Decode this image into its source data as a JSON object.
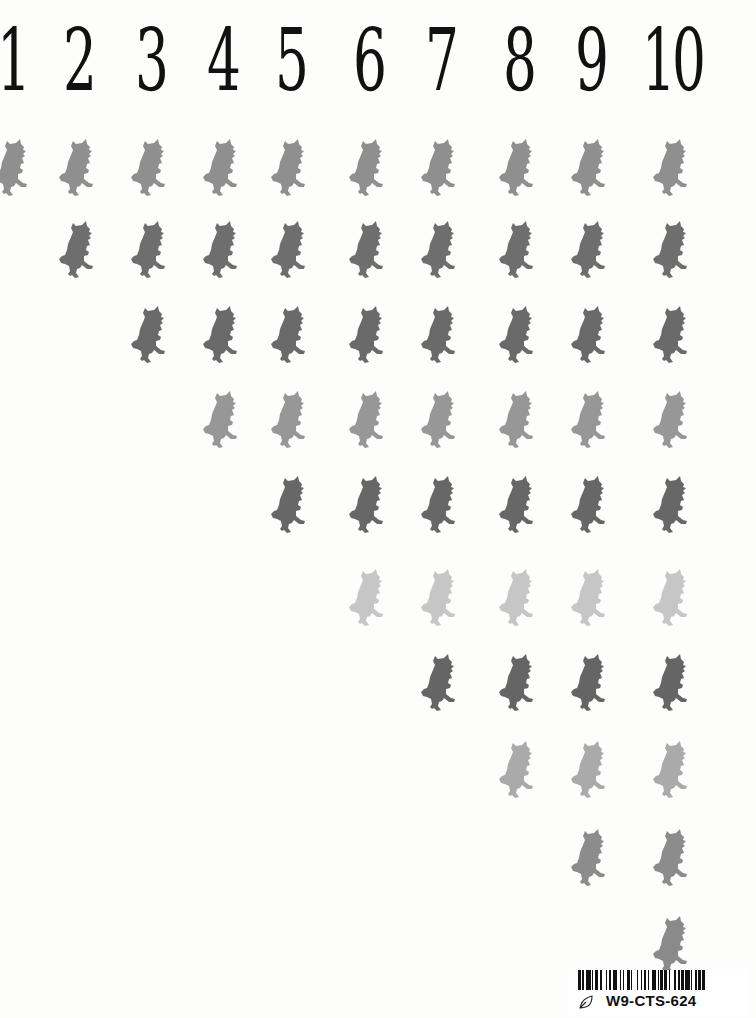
{
  "page": {
    "numbers": [
      "1",
      "2",
      "3",
      "4",
      "5",
      "6",
      "7",
      "8",
      "9",
      "10"
    ],
    "number_x": [
      12,
      78,
      150,
      222,
      290,
      368,
      440,
      518,
      590,
      672
    ],
    "figure_icon": "gruffalo-silhouette-icon",
    "rows": [
      {
        "row": 1,
        "y": 168,
        "start_col": 1,
        "color": "#8f8f8f"
      },
      {
        "row": 2,
        "y": 250,
        "start_col": 2,
        "color": "#6e6e6e"
      },
      {
        "row": 3,
        "y": 335,
        "start_col": 3,
        "color": "#6a6a6a"
      },
      {
        "row": 4,
        "y": 420,
        "start_col": 4,
        "color": "#979797"
      },
      {
        "row": 5,
        "y": 505,
        "start_col": 5,
        "color": "#676767"
      },
      {
        "row": 6,
        "y": 598,
        "start_col": 6,
        "color": "#c6c6c6"
      },
      {
        "row": 7,
        "y": 683,
        "start_col": 7,
        "color": "#656565"
      },
      {
        "row": 8,
        "y": 770,
        "start_col": 8,
        "color": "#aaaaaa"
      },
      {
        "row": 9,
        "y": 858,
        "start_col": 9,
        "color": "#8c8c8c"
      },
      {
        "row": 10,
        "y": 945,
        "start_col": 10,
        "color": "#8a8a8a"
      }
    ]
  },
  "sticker": {
    "barcode_icon": "barcode-icon",
    "leaf_icon": "leaf-outline-icon",
    "code": "W9-CTS-624"
  }
}
